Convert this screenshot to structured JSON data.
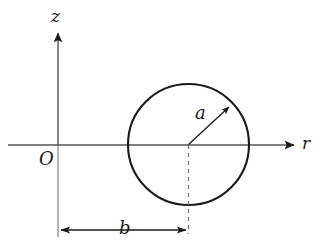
{
  "figure": {
    "name": "torus-cross-section-diagram",
    "background_color": "#fefefe",
    "stroke_color": "#1a1a1a",
    "axis_color": "#555555",
    "dashed_color": "#777777",
    "width": 322,
    "height": 251
  },
  "axes": {
    "vertical": {
      "label": "z",
      "x": 58,
      "tip_y": 30,
      "base_y": 237,
      "origin_y": 145
    },
    "horizontal": {
      "label": "r",
      "y": 145,
      "start_x": 8,
      "tip_x": 297,
      "origin_x": 58
    },
    "origin": {
      "label": "O",
      "x": 58,
      "y": 145
    }
  },
  "circle": {
    "center_x": 188.5,
    "center_y": 144.5,
    "radius": 60.5,
    "stroke_width": 2.1
  },
  "radius_arrow": {
    "label": "a",
    "from_x": 188.5,
    "from_y": 144.5,
    "to_x": 230,
    "to_y": 106,
    "angle_deg": 42
  },
  "center_line": {
    "name": "center-dashed-line",
    "x": 188.5,
    "from_y": 145,
    "to_y": 234,
    "dash": "4 4"
  },
  "dimension": {
    "label": "b",
    "y": 230,
    "from_x": 58,
    "to_x": 188.5,
    "left_extension_top_y": 145,
    "right_extension_top_y": 145
  },
  "labels": {
    "z": "z",
    "r": "r",
    "O": "O",
    "a": "a",
    "b": "b"
  }
}
